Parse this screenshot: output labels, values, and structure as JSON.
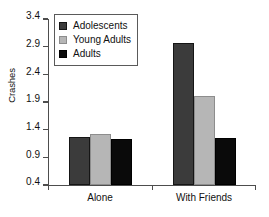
{
  "chart_data": {
    "type": "bar",
    "title": "",
    "xlabel": "",
    "ylabel": "Crashes",
    "categories": [
      "Alone",
      "With Friends"
    ],
    "series": [
      {
        "name": "Adolescents",
        "color": "#3b3b3b",
        "values": [
          1.27,
          2.96
        ]
      },
      {
        "name": "Young Adults",
        "color": "#b6b6b6",
        "values": [
          1.32,
          2.0
        ]
      },
      {
        "name": "Adults",
        "color": "#0a0a0a",
        "values": [
          1.23,
          1.25
        ]
      }
    ],
    "ylim": [
      0.4,
      3.4
    ],
    "yticks": [
      0.4,
      0.9,
      1.4,
      1.9,
      2.4,
      2.9,
      3.4
    ],
    "ytick_labels": [
      "0.4",
      "0.9",
      "1.4",
      "1.9",
      "2.4",
      "2.9",
      "3.4"
    ],
    "grid": false,
    "legend_position": "upper left"
  }
}
